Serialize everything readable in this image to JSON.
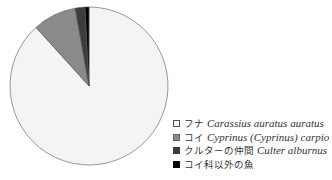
{
  "chart_data": {
    "type": "pie",
    "title": "",
    "start_angle": "12 o'clock",
    "direction": "counterclockwise",
    "legend_position": "right-bottom",
    "categories": [
      "フナ Carassius auratus auratus",
      "コイ Cyprinus (Cyprinus) carpio",
      "クルターの仲間 Culter alburnus",
      "コイ科以外の魚"
    ],
    "values": [
      88.3,
      8.9,
      2.0,
      0.8
    ],
    "colors": [
      "#f4f4f4",
      "#8a8a8a",
      "#3c3c3c",
      "#000000"
    ]
  },
  "legend": {
    "items": [
      {
        "jp": "フナ",
        "latin": "Carassius auratus auratus",
        "color": "#f4f4f4",
        "border": "#555555"
      },
      {
        "jp": "コイ",
        "latin": "Cyprinus (Cyprinus) carpio",
        "color": "#8a8a8a",
        "border": "#666666"
      },
      {
        "jp": "クルターの仲間",
        "latin": "Culter alburnus",
        "color": "#3c3c3c",
        "border": "#3c3c3c"
      },
      {
        "jp": "コイ科以外の魚",
        "latin": "",
        "color": "#000000",
        "border": "#000000"
      }
    ]
  }
}
